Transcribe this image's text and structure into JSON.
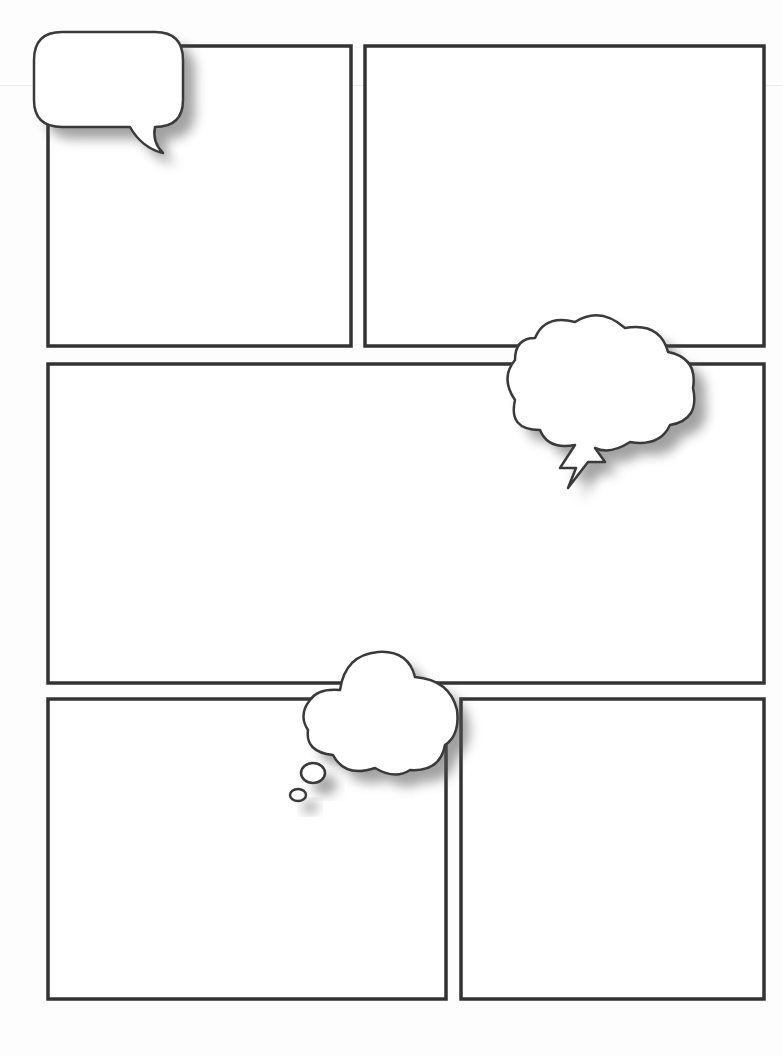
{
  "page": {
    "type": "comic-page-template",
    "background": "#fdfdfd",
    "border_color": "#333333"
  },
  "panels": [
    {
      "id": "panel-1",
      "x": 48,
      "y": 46,
      "w": 303,
      "h": 300
    },
    {
      "id": "panel-2",
      "x": 365,
      "y": 46,
      "w": 399,
      "h": 300
    },
    {
      "id": "panel-3",
      "x": 48,
      "y": 364,
      "w": 716,
      "h": 319
    },
    {
      "id": "panel-4",
      "x": 48,
      "y": 699,
      "w": 398,
      "h": 300
    },
    {
      "id": "panel-5",
      "x": 461,
      "y": 699,
      "w": 303,
      "h": 300
    }
  ],
  "bubbles": [
    {
      "id": "speech-bubble",
      "kind": "speech",
      "text": ""
    },
    {
      "id": "shout-bubble",
      "kind": "cloud-lightning",
      "text": ""
    },
    {
      "id": "thought-bubble",
      "kind": "thought",
      "text": ""
    }
  ]
}
